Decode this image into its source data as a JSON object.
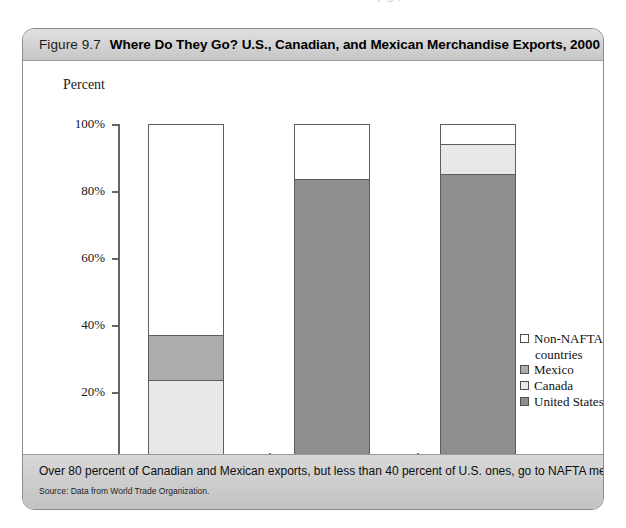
{
  "page": {
    "top_cut_text": "continued on the page, a lot of the text here is cut off at the"
  },
  "figure": {
    "number": "Figure 9.7",
    "title": "Where Do They Go? U.S., Canadian, and Mexican Merchandise Exports, 2000",
    "caption": "Over 80 percent of Canadian and Mexican exports, but less than 40 percent of U.S. ones, go to NAFTA members.",
    "source": "Source: Data from World Trade Organization."
  },
  "chart_data": {
    "type": "bar",
    "subtype": "stacked-vertical",
    "title": "Where Do They Go? U.S., Canadian, and Mexican Merchandise Exports, 2000",
    "xlabel": "",
    "ylabel": "Percent",
    "ylim": [
      0,
      100
    ],
    "ytick_labels": [
      "0%",
      "20%",
      "40%",
      "60%",
      "80%",
      "100%"
    ],
    "ytick_values": [
      0,
      20,
      40,
      60,
      80,
      100
    ],
    "grid": false,
    "legend_position": "right",
    "categories": [
      "Share of U.S. exports",
      "Share of Canadian exports",
      "Share of Mexican exports"
    ],
    "series": [
      {
        "name": "United States",
        "color": "#8e8e8e",
        "values": [
          0,
          83.5,
          85
        ]
      },
      {
        "name": "Canada",
        "color": "#e8e8e8",
        "values": [
          23.5,
          0,
          9
        ]
      },
      {
        "name": "Mexico",
        "color": "#acacac",
        "values": [
          13.5,
          0,
          0
        ]
      },
      {
        "name": "Non-NAFTA countries",
        "color": "#ffffff",
        "values": [
          63,
          16.5,
          6
        ]
      }
    ],
    "stack_order_bottom_to_top": [
      "United States",
      "Canada",
      "Mexico",
      "Non-NAFTA countries"
    ]
  },
  "legend": {
    "items": [
      {
        "label": "Non-NAFTA",
        "label2": "countries",
        "color": "#ffffff"
      },
      {
        "label": "Mexico",
        "color": "#acacac"
      },
      {
        "label": "Canada",
        "color": "#e8e8e8"
      },
      {
        "label": "United States",
        "color": "#8e8e8e"
      }
    ]
  },
  "axis": {
    "y_title": "Percent",
    "ticks": [
      "100%",
      "80%",
      "60%",
      "40%",
      "20%",
      "0%"
    ]
  }
}
